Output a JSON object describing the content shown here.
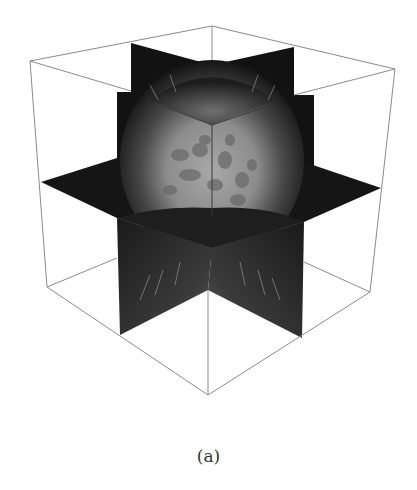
{
  "figure": {
    "type": "3d-volume-rendering",
    "caption": "(a)",
    "colors": {
      "background": "#ffffff",
      "box_edge": "#888888",
      "plane_dark": "#111111",
      "sphere_core": "#9a9a9a",
      "streak": "#cfcfcf"
    }
  }
}
